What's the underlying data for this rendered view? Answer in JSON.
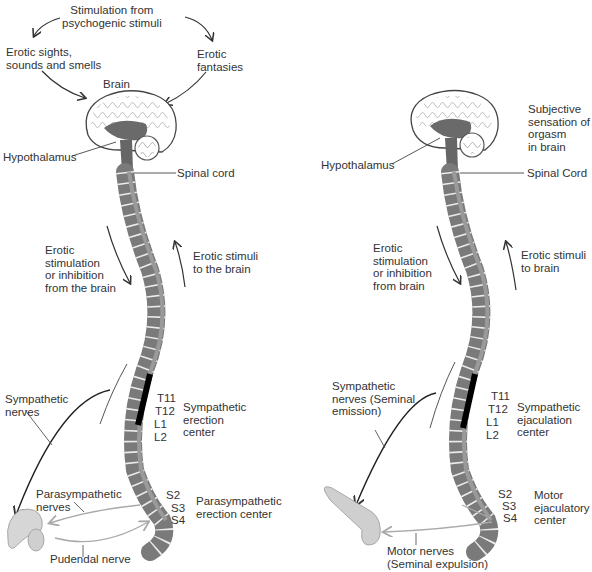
{
  "left_panel": {
    "title_label": "Stimulation from\npsychogenic stimuli",
    "sights_label": "Erotic sights,\nsounds and smells",
    "fantasies_label": "Erotic\nfantasies",
    "brain_label": "Brain",
    "hypothalamus_label": "Hypothalamus",
    "spinal_cord_label": "Spinal cord",
    "descending_label": "Erotic\nstimulation\nor inhibition\nfrom the brain",
    "ascending_label": "Erotic stimuli\nto the brain",
    "sympathetic_nerves_label": "Sympathetic\nnerves",
    "segments_upper": [
      "T11",
      "T12",
      "L1",
      "L2"
    ],
    "sympathetic_center_label": "Sympathetic\nerection\ncenter",
    "parasympathetic_nerves_label": "Parasympathetic\nnerves",
    "segments_lower": [
      "S2",
      "S3",
      "S4"
    ],
    "parasympathetic_center_label": "Parasympathetic\nerection center",
    "pudendal_label": "Pudendal nerve"
  },
  "right_panel": {
    "orgasm_label": "Subjective\nsensation of\norgasm\nin brain",
    "hypothalamus_label": "Hypothalamus",
    "spinal_cord_label": "Spinal Cord",
    "descending_label": "Erotic\nstimulation\nor inhibition\nfrom brain",
    "ascending_label": "Erotic stimuli\nto brain",
    "sympathetic_nerves_label": "Sympathetic\nnerves (Seminal\nemission)",
    "segments_upper": [
      "T11",
      "T12",
      "L1",
      "L2"
    ],
    "sympathetic_center_label": "Sympathetic\nejaculation\ncenter",
    "segments_lower": [
      "S2",
      "S3",
      "S4"
    ],
    "motor_center_label": "Motor\nejaculatory\ncenter",
    "motor_nerves_label": "Motor nerves\n(Seminal expulsion)"
  },
  "colors": {
    "spine": "#6e6e6e",
    "vertebra": "#8a8a8a",
    "cord": "#9a9a9a",
    "center_band": "#000000",
    "nerve_light": "#b8b8b8",
    "arrow": "#222222"
  }
}
